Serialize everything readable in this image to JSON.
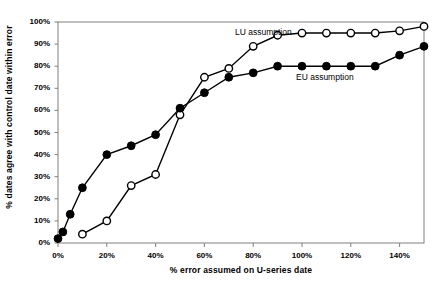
{
  "chart_data": {
    "type": "line",
    "title": "",
    "xlabel": "% error assumed on U-series date",
    "ylabel": "% dates agree with control date within error",
    "xlim": [
      0,
      150
    ],
    "ylim": [
      0,
      100
    ],
    "xticks": [
      0,
      20,
      40,
      60,
      80,
      100,
      120,
      140
    ],
    "xtick_labels": [
      "0%",
      "20%",
      "40%",
      "60%",
      "80%",
      "100%",
      "120%",
      "140%"
    ],
    "yticks": [
      0,
      10,
      20,
      30,
      40,
      50,
      60,
      70,
      80,
      90,
      100
    ],
    "ytick_labels": [
      "0%",
      "10%",
      "20%",
      "30%",
      "40%",
      "50%",
      "60%",
      "70%",
      "80%",
      "90%",
      "100%"
    ],
    "grid": false,
    "legend_position": "inline-annotations",
    "series": [
      {
        "name": "LU assumption",
        "marker": "open-circle",
        "color": "#000000",
        "fill": "#ffffff",
        "label_x": 235,
        "label_y": 27,
        "x": [
          10,
          20,
          30,
          40,
          50,
          60,
          70,
          80,
          90,
          100,
          110,
          120,
          130,
          140,
          150
        ],
        "y": [
          4,
          10,
          26,
          31,
          58,
          75,
          79,
          89,
          94,
          95,
          95,
          95,
          95,
          96,
          98
        ]
      },
      {
        "name": "EU assumption",
        "marker": "filled-circle",
        "color": "#000000",
        "fill": "#000000",
        "label_x": 296,
        "label_y": 72,
        "x": [
          0,
          2,
          5,
          10,
          20,
          30,
          40,
          50,
          60,
          70,
          80,
          90,
          100,
          110,
          120,
          130,
          140,
          150
        ],
        "y": [
          2,
          5,
          13,
          25,
          40,
          44,
          49,
          61,
          68,
          75,
          77,
          80,
          80,
          80,
          80,
          80,
          85,
          89
        ]
      }
    ]
  }
}
